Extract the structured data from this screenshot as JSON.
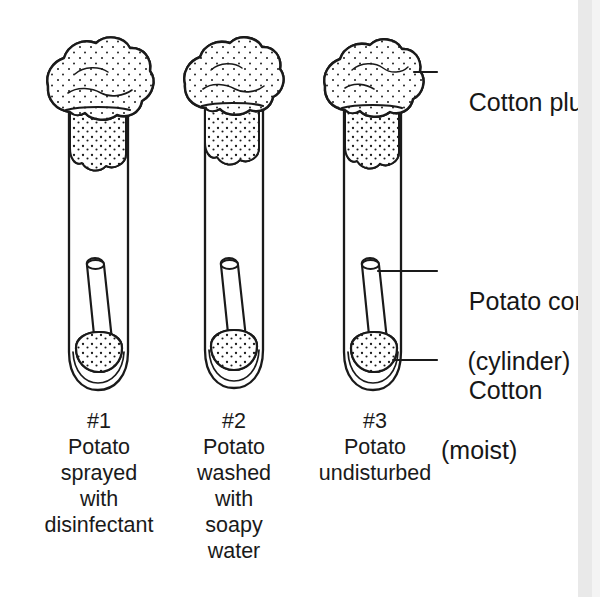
{
  "figure": {
    "background_color": "#ffffff",
    "ink_color": "#1a1a1a"
  },
  "callouts": [
    {
      "id": "cotton-plug",
      "text": "Cotton plug",
      "sub": "",
      "x": 441,
      "y": 55
    },
    {
      "id": "potato-core",
      "text": "Potato core",
      "sub": "(cylinder)",
      "x": 441,
      "y": 254
    },
    {
      "id": "cotton-moist",
      "text": "Cotton",
      "sub": "(moist)",
      "x": 441,
      "y": 348
    }
  ],
  "tubes": [
    {
      "id": "tube-1",
      "number": "#1",
      "caption_lines": [
        "#1",
        "Potato",
        "sprayed",
        "with",
        "disinfectant"
      ]
    },
    {
      "id": "tube-2",
      "number": "#2",
      "caption_lines": [
        "#2",
        "Potato",
        "washed",
        "with",
        "soapy",
        "water"
      ]
    },
    {
      "id": "tube-3",
      "number": "#3",
      "caption_lines": [
        "#3",
        "Potato",
        "undisturbed"
      ]
    }
  ],
  "parts": {
    "cotton_plug_label": "Cotton plug",
    "potato_core_label": "Potato core",
    "potato_core_sub": "(cylinder)",
    "cotton_label": "Cotton",
    "cotton_sub": "(moist)"
  }
}
